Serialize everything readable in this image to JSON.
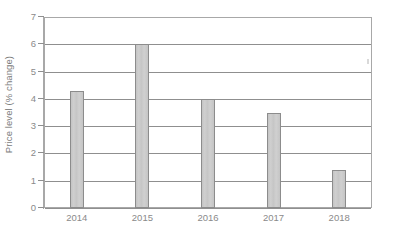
{
  "chart_data": {
    "type": "bar",
    "title": "",
    "subtitle": "",
    "xlabel": "",
    "ylabel": "Price level (% change)",
    "categories": [
      "2014",
      "2015",
      "2016",
      "2017",
      "2018"
    ],
    "values": [
      4.3,
      6.0,
      4.0,
      3.5,
      1.4
    ],
    "series": [
      {
        "name": "Price level (% change)",
        "values": [
          4.3,
          6.0,
          4.0,
          3.5,
          1.4
        ]
      }
    ],
    "ylim": [
      0,
      7
    ],
    "y_ticks": [
      0,
      1,
      2,
      3,
      4,
      5,
      6,
      7
    ],
    "y_tick_labels": [
      "0",
      "1",
      "2",
      "3",
      "4",
      "5",
      "6",
      "7"
    ],
    "x_tick_labels": [
      "2014",
      "2015",
      "2016",
      "2017",
      "2018"
    ],
    "grid": "horizontal",
    "legend": "none",
    "annotations": [],
    "colors": {
      "bar_fill": "#c9c9c9",
      "bar_border": "#8c8c8c",
      "gridline": "#8f8f8f",
      "plot_border": "#a8a8a8",
      "tick_label_text": "#8a8a8a",
      "axis_title_text": "#7c7c7c",
      "background": "#ffffff"
    }
  }
}
